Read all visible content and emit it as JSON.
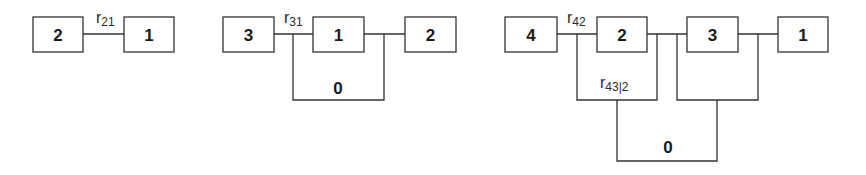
{
  "diagram": {
    "colors": {
      "line": "#333333",
      "text": "#1a1a1a",
      "background": "#ffffff"
    },
    "panels": [
      {
        "id": "panel-1",
        "nodes": [
          {
            "label": "2",
            "x": 33,
            "y": 17,
            "w": 50,
            "h": 35
          },
          {
            "label": "1",
            "x": 124,
            "y": 17,
            "w": 50,
            "h": 35
          }
        ],
        "path_labels": [
          {
            "r": "r",
            "sub": "21",
            "x": 96,
            "y": 23
          }
        ],
        "zero_labels": []
      },
      {
        "id": "panel-2",
        "nodes": [
          {
            "label": "3",
            "x": 223,
            "y": 17,
            "w": 51,
            "h": 35
          },
          {
            "label": "1",
            "x": 313,
            "y": 17,
            "w": 51,
            "h": 35
          },
          {
            "label": "2",
            "x": 405,
            "y": 17,
            "w": 51,
            "h": 35
          }
        ],
        "path_labels": [
          {
            "r": "r",
            "sub": "31",
            "x": 284,
            "y": 23
          }
        ],
        "zero_labels": [
          {
            "label": "0",
            "x": 338,
            "y": 94
          }
        ]
      },
      {
        "id": "panel-3",
        "nodes": [
          {
            "label": "4",
            "x": 505,
            "y": 17,
            "w": 52,
            "h": 35
          },
          {
            "label": "2",
            "x": 597,
            "y": 17,
            "w": 50,
            "h": 35
          },
          {
            "label": "3",
            "x": 687,
            "y": 17,
            "w": 51,
            "h": 35
          },
          {
            "label": "1",
            "x": 778,
            "y": 17,
            "w": 50,
            "h": 35
          }
        ],
        "path_labels": [
          {
            "r": "r",
            "sub": "42",
            "x": 567,
            "y": 23
          },
          {
            "r": "r",
            "sub": "43|2",
            "x": 600,
            "y": 88
          }
        ],
        "zero_labels": [
          {
            "label": "0",
            "x": 668,
            "y": 153
          }
        ]
      }
    ]
  }
}
